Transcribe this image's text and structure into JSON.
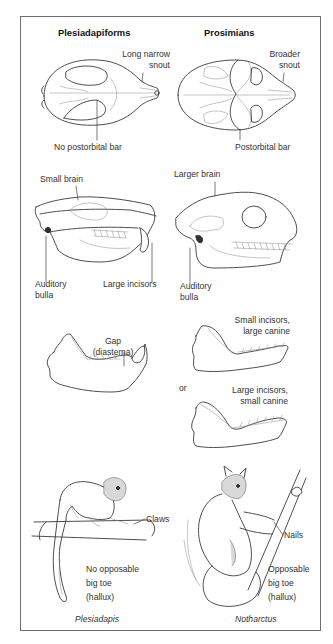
{
  "headers": {
    "left": "Plesiadapiforms",
    "right": "Prosimians"
  },
  "skull_top": {
    "left_snout": [
      "Long narrow",
      "snout"
    ],
    "left_bar": "No postorbital bar",
    "right_snout": [
      "Broader",
      "snout"
    ],
    "right_bar": "Postorbital bar"
  },
  "skull_side": {
    "left_brain": "Small brain",
    "left_bulla": [
      "Auditory",
      "bulla"
    ],
    "left_incisors": "Large incisors",
    "right_brain": "Larger brain",
    "right_bulla": [
      "Auditory",
      "bulla"
    ]
  },
  "jaws": {
    "left_gap": [
      "Gap",
      "(diastema)"
    ],
    "right_upper": [
      "Small incisors,",
      "large canine"
    ],
    "or": "or",
    "right_lower": [
      "Large incisors,",
      "small canine"
    ]
  },
  "animals": {
    "left_claws": "Claws",
    "left_toe": [
      "No opposable",
      "big toe",
      "(hallux)"
    ],
    "left_name": "Plesiadapis",
    "right_nails": "Nails",
    "right_toe": [
      "Opposable",
      "big toe",
      "(hallux)"
    ],
    "right_name": "Notharctus"
  }
}
